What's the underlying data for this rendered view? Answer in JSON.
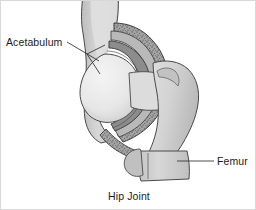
{
  "figure": {
    "title": "Hip Joint",
    "caption": "Hip Joint",
    "background_color": "#ffffff",
    "border_color": "#d8d8d8",
    "width": 256,
    "height": 210
  },
  "labels": [
    {
      "id": "acetabulum",
      "text": "Acetabulum",
      "x": 5,
      "y": 45,
      "anchor": "start",
      "leader_color": "#3a3a3a"
    },
    {
      "id": "femur",
      "text": "Femur",
      "x": 216,
      "y": 164,
      "anchor": "start",
      "leader_color": "#3a3a3a"
    }
  ],
  "caption_block": {
    "text": "Hip Joint",
    "x": 128,
    "y": 199,
    "anchor": "middle"
  },
  "structures": [
    {
      "id": "ilium",
      "name": "Ilium / pelvic bone",
      "fill": "#c9c9c9",
      "stroke": "#4a4a4a"
    },
    {
      "id": "acetabular-rim",
      "name": "Acetabular rim (stippled bone)",
      "fill": "#9e9e9e",
      "stroke": "#3f3f3f"
    },
    {
      "id": "articular-cartilage",
      "name": "Articular cartilage band",
      "fill": "#8a8a8a",
      "stroke": "#383838"
    },
    {
      "id": "joint-capsule",
      "name": "Joint capsule",
      "fill": "#b5b5b5",
      "stroke": "#454545"
    },
    {
      "id": "femoral-head",
      "name": "Femoral head",
      "fill": "#e9e9e9",
      "stroke": "#4a4a4a"
    },
    {
      "id": "greater-trochanter",
      "name": "Greater trochanter",
      "fill": "#d4d4d4",
      "stroke": "#4a4a4a"
    },
    {
      "id": "femoral-shaft",
      "name": "Femoral shaft",
      "fill": "#cfcfcf",
      "stroke": "#4a4a4a"
    },
    {
      "id": "lesser-trochanter",
      "name": "Lesser trochanter",
      "fill": "#bdbdbd",
      "stroke": "#4a4a4a"
    }
  ],
  "palette": {
    "text": "#1b1b1b",
    "outline": "#4a4a4a",
    "light_bone": "#e9e9e9",
    "mid_bone": "#cfcfcf",
    "dark_cartilage": "#8a8a8a",
    "stipple": "#6f6f6f"
  }
}
